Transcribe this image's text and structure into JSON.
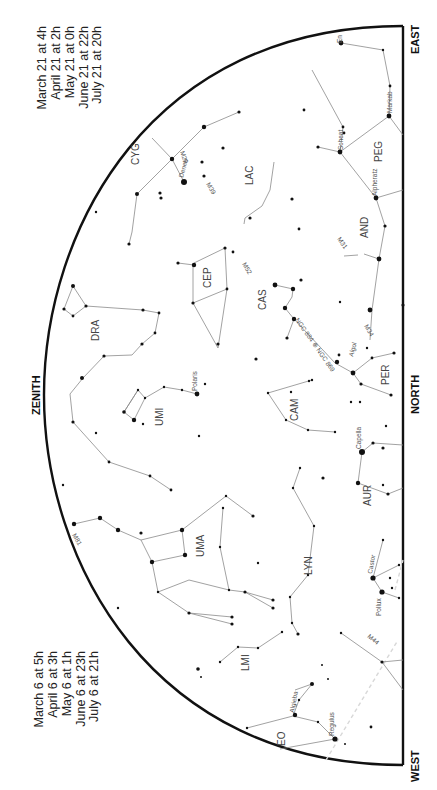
{
  "directions": {
    "east": "EAST",
    "north": "NORTH",
    "west": "WEST",
    "zenith": "ZENITH"
  },
  "time_table_top": [
    "March 21 at   4h",
    "April 21 at   2h",
    "May 21 at   0h",
    "June 21 at 22h",
    "July 21 at 20h"
  ],
  "time_table_bottom": [
    "March 6 at   5h",
    "April 6 at   3h",
    "May 6 at   1h",
    "June 6 at 23h",
    "July 6 at 21h"
  ],
  "constellations": {
    "cyg": "CYG",
    "lac": "LAC",
    "peg": "PEG",
    "and": "AND",
    "cep": "CEP",
    "cas": "CAS",
    "dra": "DRA",
    "per": "PER",
    "umi": "UMI",
    "cam": "CAM",
    "aur": "AUR",
    "uma": "UMA",
    "lyn": "LYN",
    "lmi": "LMI",
    "leo": "EO"
  },
  "star_names": {
    "deneb": "Deneb",
    "scheat": "Scheat",
    "markab": "Markab",
    "alpheratz": "Alpheratz",
    "algol": "Algol",
    "polaris": "Polaris",
    "capella": "Capella",
    "castor": "Castor",
    "pollux": "Pollux",
    "algieba": "Algieba",
    "regulus": "Regulus",
    "enif": "En"
  },
  "deep_sky": {
    "m29": "M29",
    "m39": "M39",
    "m52": "M52",
    "m31": "M31",
    "ngc": "NGC 884 ⊕ NGC 869",
    "m34": "M34",
    "m81": "M81",
    "m44": "M44"
  }
}
